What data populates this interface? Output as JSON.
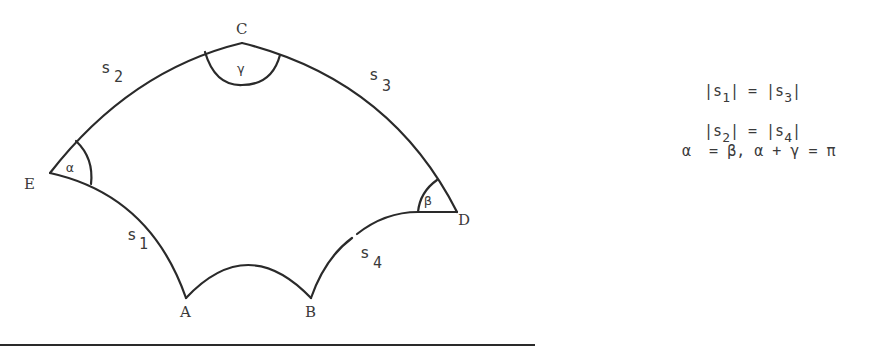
{
  "figure": {
    "type": "curvilinear pentagon (hyperbolic-style polygon)",
    "vertices": {
      "A": "A",
      "B": "B",
      "C": "C",
      "D": "D",
      "E": "E"
    },
    "sides": {
      "s1": {
        "base": "s",
        "sub": "1"
      },
      "s2": {
        "base": "s",
        "sub": "2"
      },
      "s3": {
        "base": "s",
        "sub": "3"
      },
      "s4": {
        "base": "s",
        "sub": "4"
      }
    },
    "angles": {
      "alpha": "α",
      "beta": "β",
      "gamma": "γ"
    }
  },
  "equations": {
    "line1": {
      "left_base": "|s",
      "left_sub": "1",
      "left_close": "|",
      "op": " = ",
      "right_base": "|s",
      "right_sub": "3",
      "right_close": "|"
    },
    "line2": {
      "left_base": "|s",
      "left_sub": "2",
      "left_close": "|",
      "op": " = ",
      "right_base": "|s",
      "right_sub": "4",
      "right_close": "|"
    },
    "line3": "α  = β, α + γ = π"
  },
  "colors": {
    "stroke": "#2a2a2a",
    "text": "#3a3a3a",
    "background": "#ffffff"
  }
}
